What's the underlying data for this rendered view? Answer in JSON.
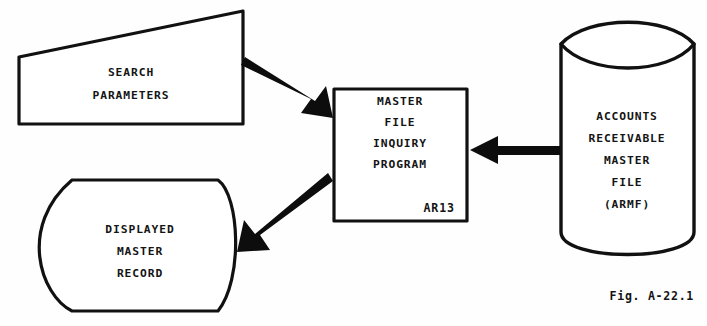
{
  "figure": {
    "caption": "Fig. A-22.1",
    "background_color": "#fefefe",
    "ink_color": "#111111"
  },
  "nodes": {
    "search_parameters": {
      "shape": "input-parallelogram",
      "lines": [
        "SEARCH",
        "PARAMETERS"
      ],
      "line1": "SEARCH",
      "line2": "PARAMETERS"
    },
    "inquiry_program": {
      "shape": "process-rectangle",
      "lines": [
        "MASTER",
        "FILE",
        "INQUIRY",
        "PROGRAM"
      ],
      "line1": "MASTER",
      "line2": "FILE",
      "line3": "INQUIRY",
      "line4": "PROGRAM",
      "code": "AR13"
    },
    "master_file": {
      "shape": "cylinder-database",
      "lines": [
        "ACCOUNTS",
        "RECEIVABLE",
        "MASTER",
        "FILE",
        "(ARMF)"
      ],
      "line1": "ACCOUNTS",
      "line2": "RECEIVABLE",
      "line3": "MASTER",
      "line4": "FILE",
      "line5": "(ARMF)"
    },
    "displayed_record": {
      "shape": "display-symbol",
      "lines": [
        "DISPLAYED",
        "MASTER",
        "RECORD"
      ],
      "line1": "DISPLAYED",
      "line2": "MASTER",
      "line3": "RECORD"
    }
  },
  "edges": [
    {
      "id": "search-to-program",
      "from": "search_parameters",
      "to": "inquiry_program",
      "direction": "down-right",
      "label": ""
    },
    {
      "id": "masterfile-to-program",
      "from": "master_file",
      "to": "inquiry_program",
      "direction": "left",
      "label": ""
    },
    {
      "id": "program-to-display",
      "from": "inquiry_program",
      "to": "displayed_record",
      "direction": "down-left",
      "label": ""
    }
  ]
}
